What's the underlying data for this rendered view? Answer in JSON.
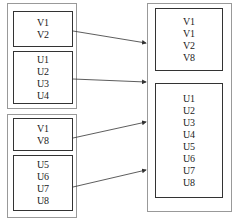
{
  "left_groups": [
    {
      "top_block": [
        "V1",
        "V2"
      ],
      "bottom_block": [
        "U1",
        "U2",
        "U3",
        "U4"
      ]
    },
    {
      "top_block": [
        "V1",
        "V8"
      ],
      "bottom_block": [
        "U5",
        "U6",
        "U7",
        "U8"
      ]
    }
  ],
  "right_group": {
    "top_block": [
      "V1",
      "V1",
      "V2",
      "V8"
    ],
    "bottom_block": [
      "U1",
      "U2",
      "U3",
      "U4",
      "U5",
      "U6",
      "U7",
      "U8"
    ]
  },
  "colors": {
    "line": "#333333",
    "outer_border": "#999999"
  }
}
